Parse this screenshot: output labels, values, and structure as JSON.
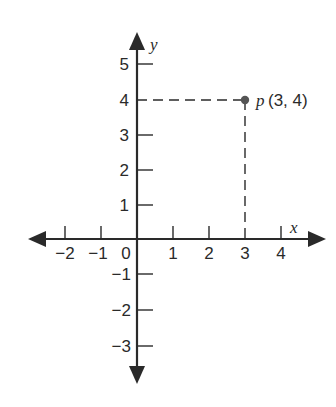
{
  "diagram": {
    "type": "coordinate-plane",
    "axes": {
      "x_label": "x",
      "y_label": "y",
      "x_ticks": [
        {
          "value": -2,
          "label": "−2"
        },
        {
          "value": -1,
          "label": "−1"
        },
        {
          "value": 1,
          "label": "1"
        },
        {
          "value": 2,
          "label": "2"
        },
        {
          "value": 3,
          "label": "3"
        },
        {
          "value": 4,
          "label": "4"
        }
      ],
      "origin_label": "0",
      "y_ticks": [
        {
          "value": 5,
          "label": "5"
        },
        {
          "value": 4,
          "label": "4"
        },
        {
          "value": 3,
          "label": "3"
        },
        {
          "value": 2,
          "label": "2"
        },
        {
          "value": 1,
          "label": "1"
        },
        {
          "value": -1,
          "label": "−1"
        },
        {
          "value": -2,
          "label": "−2"
        },
        {
          "value": -3,
          "label": "−3"
        }
      ]
    },
    "point": {
      "name": "p",
      "coords_label": "(3, 4)",
      "x": 3,
      "y": 4
    },
    "colors": {
      "axis": "#2a2a2a",
      "point": "#555555",
      "background": "#ffffff"
    }
  }
}
